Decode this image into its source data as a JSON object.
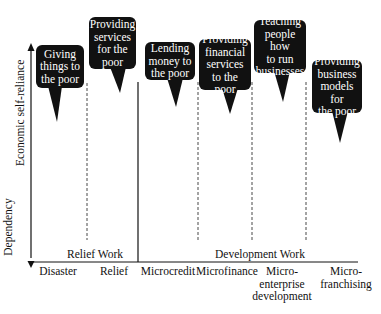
{
  "axes": {
    "y_top_label": "Economic self-reliance",
    "y_bottom_label": "Dependency"
  },
  "groups": [
    {
      "label": "Relief Work"
    },
    {
      "label": "Development Work"
    }
  ],
  "categories": [
    {
      "label_lines": [
        "Disaster"
      ]
    },
    {
      "label_lines": [
        "Relief"
      ]
    },
    {
      "label_lines": [
        "Microcredit"
      ]
    },
    {
      "label_lines": [
        "Microfinance"
      ]
    },
    {
      "label_lines": [
        "Micro-",
        "enterprise",
        "development"
      ]
    },
    {
      "label_lines": [
        "Micro-",
        "franchising"
      ]
    }
  ],
  "bubbles": [
    {
      "lines": [
        "Giving",
        "things to",
        "the poor"
      ]
    },
    {
      "lines": [
        "Providing",
        "services",
        "for the",
        "poor"
      ]
    },
    {
      "lines": [
        "Lending",
        "money to",
        "the poor"
      ]
    },
    {
      "lines": [
        "Providing",
        "financial",
        "services",
        "to the poor"
      ]
    },
    {
      "lines": [
        "Teaching",
        "people how",
        "to run",
        "businesses"
      ]
    },
    {
      "lines": [
        "Providing",
        "business",
        "models for",
        "the poor"
      ]
    }
  ],
  "colors": {
    "bubble_fill": "#111111",
    "bubble_text": "#ffffff",
    "line": "#111111"
  }
}
